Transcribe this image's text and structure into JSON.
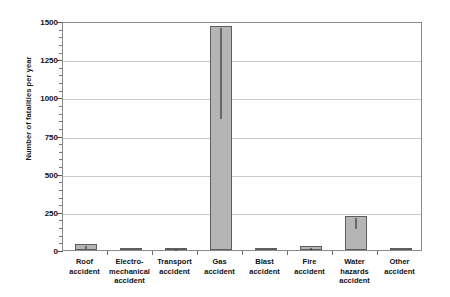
{
  "chart_data": {
    "type": "bar",
    "title": "",
    "xlabel": "",
    "ylabel": "Number of fatalities per year",
    "ylim": [
      0,
      1500
    ],
    "yticks": [
      0,
      250,
      500,
      750,
      1000,
      1250,
      1500
    ],
    "ytick_labels": [
      "0",
      "250",
      "500",
      "750",
      "1000",
      "1250",
      "1500"
    ],
    "grid": true,
    "legend": "none",
    "categories": [
      "Roof accident",
      "Electro-mechanical accident",
      "Transport accident",
      "Gas accident",
      "Blast accident",
      "Fire accident",
      "Water hazards accident",
      "Other accident"
    ],
    "category_lines": [
      [
        "Roof",
        "accident"
      ],
      [
        "Electro-",
        "mechanical",
        "accident"
      ],
      [
        "Transport",
        "accident"
      ],
      [
        "Gas",
        "accident"
      ],
      [
        "Blast",
        "accident"
      ],
      [
        "Fire",
        "accident"
      ],
      [
        "Water",
        "hazards",
        "accident"
      ],
      [
        "Other",
        "accident"
      ]
    ],
    "values": [
      38,
      3,
      16,
      1470,
      2,
      24,
      220,
      2
    ],
    "error_low": [
      20,
      0,
      8,
      870,
      0,
      12,
      150,
      0
    ],
    "bar_color": "#b5b5b5",
    "bar_edge_color": "#5d5d5d",
    "error_color": "#1d1d1d",
    "grid_color": "#c9c9c9",
    "frame_color": "#8a8a8a"
  }
}
